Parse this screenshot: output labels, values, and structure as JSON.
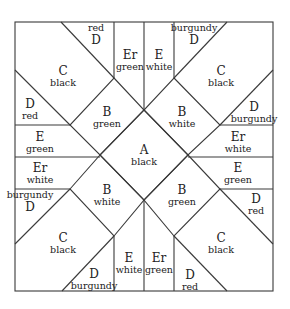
{
  "diagram": {
    "type": "quilt-block-pattern",
    "pieces": [
      {
        "id": "A-center",
        "letter": "A",
        "color": "black",
        "x": 144,
        "y": 155,
        "order": "letter-first"
      },
      {
        "id": "B-top-left",
        "letter": "B",
        "color": "green",
        "x": 107,
        "y": 117,
        "order": "letter-first"
      },
      {
        "id": "B-top-right",
        "letter": "B",
        "color": "white",
        "x": 182,
        "y": 117,
        "order": "letter-first"
      },
      {
        "id": "B-bottom-left",
        "letter": "B",
        "color": "white",
        "x": 107,
        "y": 195,
        "order": "letter-first"
      },
      {
        "id": "B-bottom-right",
        "letter": "B",
        "color": "green",
        "x": 182,
        "y": 195,
        "order": "letter-first"
      },
      {
        "id": "C-top-left",
        "letter": "C",
        "color": "black",
        "x": 63,
        "y": 76,
        "order": "letter-first"
      },
      {
        "id": "C-top-right",
        "letter": "C",
        "color": "black",
        "x": 221,
        "y": 76,
        "order": "letter-first"
      },
      {
        "id": "C-bottom-left",
        "letter": "C",
        "color": "black",
        "x": 63,
        "y": 243,
        "order": "letter-first"
      },
      {
        "id": "C-bottom-right",
        "letter": "C",
        "color": "black",
        "x": 221,
        "y": 243,
        "order": "letter-first"
      },
      {
        "id": "D-top-left-top",
        "letter": "D",
        "color": "red",
        "x": 96,
        "y": 34,
        "order": "color-first"
      },
      {
        "id": "D-top-left-side",
        "letter": "D",
        "color": "red",
        "x": 30,
        "y": 109,
        "order": "letter-first"
      },
      {
        "id": "D-top-right-top",
        "letter": "D",
        "color": "burgundy",
        "x": 194,
        "y": 34,
        "order": "color-first"
      },
      {
        "id": "D-top-right-side",
        "letter": "D",
        "color": "burgundy",
        "x": 254,
        "y": 112,
        "order": "letter-first"
      },
      {
        "id": "D-bottom-left-side",
        "letter": "D",
        "color": "burgundy",
        "x": 30,
        "y": 201,
        "order": "color-first"
      },
      {
        "id": "D-bottom-left-bottom",
        "letter": "D",
        "color": "burgundy",
        "x": 94,
        "y": 279,
        "order": "letter-first"
      },
      {
        "id": "D-bottom-right-side",
        "letter": "D",
        "color": "red",
        "x": 256,
        "y": 204,
        "order": "letter-first"
      },
      {
        "id": "D-bottom-right-bottom",
        "letter": "D",
        "color": "red",
        "x": 190,
        "y": 280,
        "order": "letter-first"
      },
      {
        "id": "Er-top",
        "letter": "Er",
        "color": "green",
        "x": 130,
        "y": 60,
        "order": "letter-first"
      },
      {
        "id": "E-top",
        "letter": "E",
        "color": "white",
        "x": 159,
        "y": 60,
        "order": "letter-first"
      },
      {
        "id": "E-left",
        "letter": "E",
        "color": "green",
        "x": 40,
        "y": 142,
        "order": "letter-first"
      },
      {
        "id": "Er-left",
        "letter": "Er",
        "color": "white",
        "x": 40,
        "y": 173,
        "order": "letter-first"
      },
      {
        "id": "Er-right",
        "letter": "Er",
        "color": "white",
        "x": 238,
        "y": 142,
        "order": "letter-first"
      },
      {
        "id": "E-right",
        "letter": "E",
        "color": "green",
        "x": 238,
        "y": 173,
        "order": "letter-first"
      },
      {
        "id": "E-bottom",
        "letter": "E",
        "color": "white",
        "x": 129,
        "y": 263,
        "order": "letter-first"
      },
      {
        "id": "Er-bottom",
        "letter": "Er",
        "color": "green",
        "x": 159,
        "y": 263,
        "order": "letter-first"
      }
    ]
  }
}
